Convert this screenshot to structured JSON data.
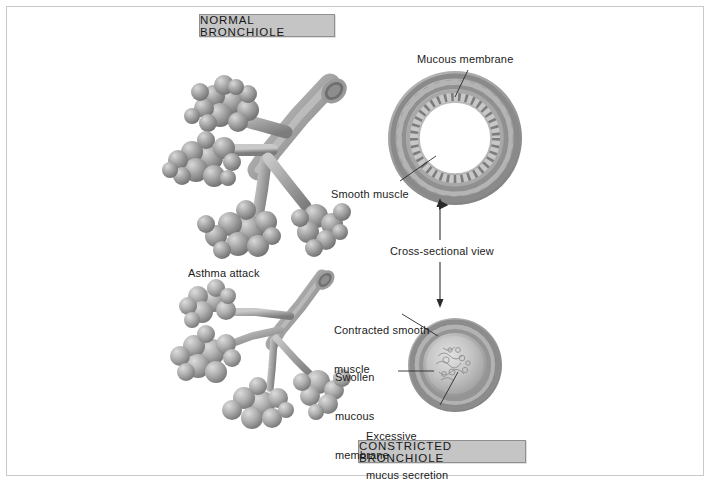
{
  "figure": {
    "title_top": "NORMAL BRONCHIOLE",
    "title_bottom": "CONSTRICTED BRONCHIOLE",
    "center_axis_label": "Cross-sectional view"
  },
  "labels": {
    "mucous_membrane": "Mucous membrane",
    "smooth_muscle": "Smooth muscle",
    "asthma_attack": "Asthma attack",
    "contracted_smooth_muscle_line1": "Contracted smooth",
    "contracted_smooth_muscle_line2": "muscle",
    "swollen_line1": "Swollen",
    "swollen_line2": "mucous",
    "swollen_line3": "membrane",
    "excessive_line1": "Excessive",
    "excessive_line2": "mucus secretion"
  },
  "colors": {
    "tissue_mid": "#8e8e8e",
    "tissue_light": "#c4c4c4",
    "tissue_dark": "#6a6a6a",
    "label_box_fill": "#c5c5c5",
    "label_box_border": "#8f8f8f",
    "frame_border": "#c9c9c9",
    "text": "#1b1b1b",
    "leader_line": "#2a2a2a"
  },
  "icons": {
    "double_arrow": "double-headed-vertical-arrow"
  }
}
